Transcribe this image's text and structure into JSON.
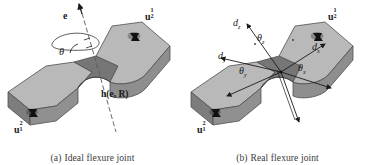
{
  "figure": {
    "background": "#ffffff",
    "panels": [
      {
        "id": "ideal",
        "caption_tag": "(a)",
        "caption_text": "Ideal flexure joint",
        "labels": {
          "axis_vector": "e",
          "angle": "θ",
          "transform": "h(e, R)",
          "node_top_base": "u",
          "node_top_sub": "2",
          "node_top_sup": "1",
          "node_bottom_base": "u",
          "node_bottom_sub": "1",
          "node_bottom_sup": "2"
        }
      },
      {
        "id": "real",
        "caption_tag": "(b)",
        "caption_text": "Real flexure joint",
        "labels": {
          "d_z": "d",
          "d_z_sub": "z",
          "d_x": "d",
          "d_x_sub": "x",
          "d_y": "d",
          "d_y_sub": "y",
          "theta_z": "θ",
          "theta_z_sub": "z",
          "theta_x": "θ",
          "theta_x_sub": "x",
          "theta_y": "θ",
          "theta_y_sub": "y",
          "node_top_base": "u",
          "node_top_sub": "2",
          "node_top_sup": "1",
          "node_bottom_base": "u",
          "node_bottom_sub": "1",
          "node_bottom_sup": "2"
        }
      }
    ],
    "colors": {
      "body_top": "#b4b4b4",
      "body_front": "#8e8e8e",
      "body_side": "#7c7c7c",
      "body_notch": "#6f6f6f",
      "outline": "#4a4a4a",
      "marker": "#141414",
      "text": "#1a1a1a",
      "caption_text": "#3a3a3a"
    }
  }
}
